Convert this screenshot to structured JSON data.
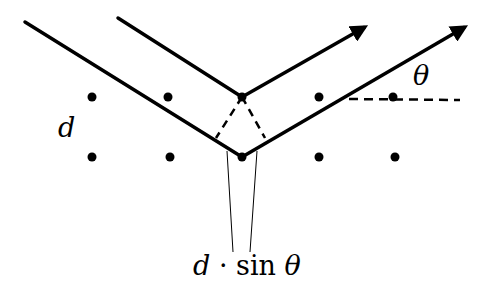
{
  "diagram": {
    "labels": {
      "spacing": "d",
      "angle": "θ",
      "path_difference_d": "d",
      "path_difference_op": " · sin ",
      "path_difference_theta": "θ"
    },
    "lattice_points": [
      {
        "x": 92,
        "y": 97
      },
      {
        "x": 168,
        "y": 97
      },
      {
        "x": 242,
        "y": 97
      },
      {
        "x": 319,
        "y": 97
      },
      {
        "x": 393,
        "y": 97
      },
      {
        "x": 92,
        "y": 157
      },
      {
        "x": 170,
        "y": 157
      },
      {
        "x": 242,
        "y": 157
      },
      {
        "x": 319,
        "y": 157
      },
      {
        "x": 395,
        "y": 157
      }
    ],
    "rays": [
      {
        "name": "upper-ray",
        "in_start": [
          118,
          18
        ],
        "vertex": [
          242,
          97
        ],
        "out_end": [
          367,
          25
        ]
      },
      {
        "name": "lower-ray",
        "in_start": [
          25,
          22
        ],
        "vertex": [
          242,
          157
        ],
        "out_end": [
          467,
          25
        ]
      }
    ],
    "colors": {
      "ink": "#000000",
      "background": "#ffffff"
    }
  }
}
